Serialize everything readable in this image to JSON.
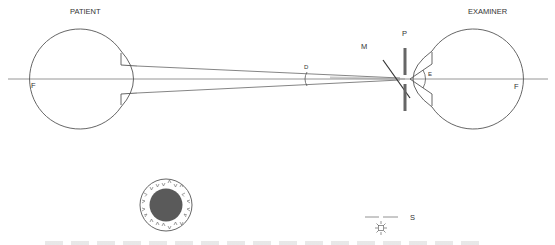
{
  "diagram": {
    "labels": {
      "patient": "PATIENT",
      "examiner": "EXAMINER",
      "patient_fundus": "F",
      "examiner_fundus": "F",
      "mirror": "M",
      "pinhole": "P",
      "examiner_angle": "E",
      "divergence_angle": "D",
      "source": "S"
    },
    "colors": {
      "line": "#555555",
      "axis": "#888888",
      "pinhole_plate": "#666666",
      "pupil": "#555555"
    },
    "icons": {
      "light_source": "sun-icon"
    }
  }
}
